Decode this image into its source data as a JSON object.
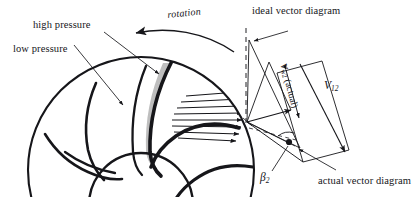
{
  "figure": {
    "kind": "centrifugal-pump-impeller-velocity-diagram",
    "background_color": "#ffffff",
    "ink_color": "#16161a",
    "shade_color": "#b9b9b9"
  },
  "labels": {
    "high_pressure": "high pressure",
    "low_pressure": "low pressure",
    "rotation": "rotation",
    "ideal_vector_diagram": "ideal vector diagram",
    "actual_vector_diagram": "actual vector diagram",
    "v_w2_symbol": "V",
    "v_w2_subscript": "w2",
    "v_w2_qualifier": "(actual)",
    "v12_symbol": "V",
    "v12_subscript": "12",
    "beta2_symbol": "β",
    "beta2_subscript": "2"
  },
  "impeller": {
    "outer_circle": {
      "cx": 141,
      "cy": 170,
      "r": 113
    },
    "hub_circle": {
      "cx": 141,
      "cy": 205,
      "r": 52
    },
    "blade_count": 6,
    "shaded_blade_passage": true,
    "velocity_profile_arrows": 8
  },
  "vector_diagram": {
    "apex_top": {
      "x": 249,
      "y": 40
    },
    "left_vertex": {
      "x": 247,
      "y": 122
    },
    "v12_tip": {
      "x": 345,
      "y": 152
    },
    "ideal_tip": {
      "x": 300,
      "y": 64
    },
    "actual_tip": {
      "x": 291,
      "y": 110
    },
    "dashed_vertical_x": 246,
    "beta2_angle_marker": true
  }
}
